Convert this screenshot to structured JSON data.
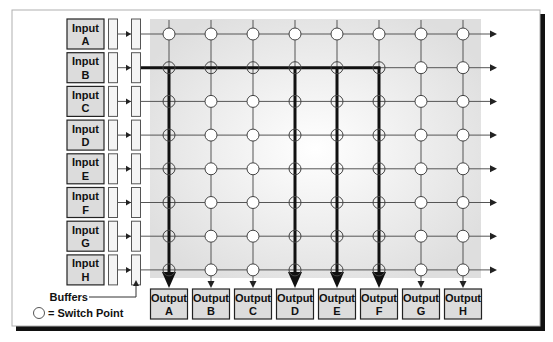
{
  "diagram": {
    "inputs": [
      {
        "line1": "Input",
        "line2": "A"
      },
      {
        "line1": "Input",
        "line2": "B"
      },
      {
        "line1": "Input",
        "line2": "C"
      },
      {
        "line1": "Input",
        "line2": "D"
      },
      {
        "line1": "Input",
        "line2": "E"
      },
      {
        "line1": "Input",
        "line2": "F"
      },
      {
        "line1": "Input",
        "line2": "G"
      },
      {
        "line1": "Input",
        "line2": "H"
      }
    ],
    "outputs": [
      {
        "line1": "Output",
        "line2": "A"
      },
      {
        "line1": "Output",
        "line2": "B"
      },
      {
        "line1": "Output",
        "line2": "C"
      },
      {
        "line1": "Output",
        "line2": "D"
      },
      {
        "line1": "Output",
        "line2": "E"
      },
      {
        "line1": "Output",
        "line2": "F"
      },
      {
        "line1": "Output",
        "line2": "G"
      },
      {
        "line1": "Output",
        "line2": "H"
      }
    ],
    "active_input_index": 1,
    "active_output_indices": [
      0,
      3,
      4,
      5
    ],
    "legend": {
      "buffers_label": "Buffers",
      "switch_point_label": "= Switch Point"
    },
    "colors": {
      "box_fill": "#dcdcdc",
      "grid_bg": "#e6e6e6",
      "line": "#555555",
      "active_line": "#111111",
      "frame": "#aaaaaa",
      "shadow": "#111111"
    }
  }
}
